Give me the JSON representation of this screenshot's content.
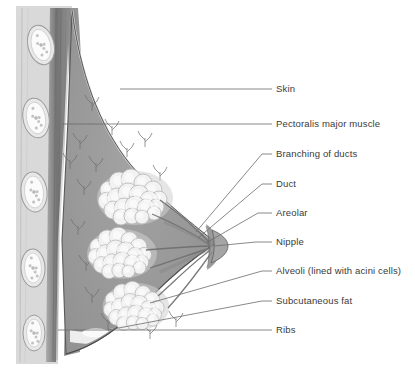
{
  "diagram": {
    "background": "#ffffff",
    "palette": {
      "skin_line": "#4a4a4a",
      "stroma": "#9a9a9a",
      "stroma_dark": "#7e7e7e",
      "muscle": "#8d8d8d",
      "muscle_dark": "#6f6f6f",
      "rib": "#e8e8e8",
      "rib_edge": "#9b9b9b",
      "lobule": "#f2f2f2",
      "lobule_edge": "#b5b5b5",
      "fat": "#f4f4f4",
      "areola": "#8a8a8a",
      "nipple": "#a5a5a5",
      "leader": "#6b6b6b",
      "text": "#3a3a3a"
    }
  },
  "labels": [
    {
      "id": "skin",
      "text": "Skin",
      "text_x": 276,
      "text_y": 89,
      "dash_x1": 262,
      "dash_x2": 272,
      "leader_x": 262,
      "leader_y": 89,
      "target_x": 120,
      "target_y": 89
    },
    {
      "id": "pectoralis",
      "text": "Pectoralis major muscle",
      "text_x": 276,
      "text_y": 124,
      "dash_x1": 262,
      "dash_x2": 272,
      "leader_x": 262,
      "leader_y": 124,
      "target_x": 62,
      "target_y": 124
    },
    {
      "id": "branching",
      "text": "Branching of ducts",
      "text_x": 276,
      "text_y": 154,
      "dash_x1": 262,
      "dash_x2": 272,
      "leader_x": 262,
      "leader_y": 154,
      "target_x": 196,
      "target_y": 232
    },
    {
      "id": "duct",
      "text": "Duct",
      "text_x": 276,
      "text_y": 184,
      "dash_x1": 262,
      "dash_x2": 272,
      "leader_x": 262,
      "leader_y": 184,
      "target_x": 198,
      "target_y": 238
    },
    {
      "id": "areolar",
      "text": "Areolar",
      "text_x": 276,
      "text_y": 213,
      "dash_x1": 258,
      "dash_x2": 272,
      "leader_x": 258,
      "leader_y": 213,
      "target_x": 206,
      "target_y": 243
    },
    {
      "id": "nipple",
      "text": "Nipple",
      "text_x": 276,
      "text_y": 242,
      "dash_x1": 256,
      "dash_x2": 272,
      "leader_x": 256,
      "leader_y": 242,
      "target_x": 214,
      "target_y": 246
    },
    {
      "id": "alveoli",
      "text": "Alveoli (lined with acini cells)",
      "text_x": 276,
      "text_y": 271,
      "dash_x1": 262,
      "dash_x2": 272,
      "leader_x": 262,
      "leader_y": 271,
      "target_x": 150,
      "target_y": 303
    },
    {
      "id": "subcutaneous",
      "text": "Subcutaneous fat",
      "text_x": 276,
      "text_y": 301,
      "dash_x1": 262,
      "dash_x2": 272,
      "leader_x": 262,
      "leader_y": 301,
      "target_x": 108,
      "target_y": 330
    },
    {
      "id": "ribs",
      "text": "Ribs",
      "text_x": 276,
      "text_y": 330,
      "dash_x1": 262,
      "dash_x2": 272,
      "leader_x": 262,
      "leader_y": 330,
      "target_x": 58,
      "target_y": 330
    }
  ],
  "anatomy": {
    "ribs": [
      {
        "cx": 41,
        "cy": 45,
        "rx": 13,
        "ry": 20,
        "rot": -14
      },
      {
        "cx": 36,
        "cy": 118,
        "rx": 13,
        "ry": 20,
        "rot": -10
      },
      {
        "cx": 34,
        "cy": 192,
        "rx": 13,
        "ry": 20,
        "rot": -6
      },
      {
        "cx": 33,
        "cy": 268,
        "rx": 12,
        "ry": 19,
        "rot": -2
      },
      {
        "cx": 34,
        "cy": 333,
        "rx": 11,
        "ry": 18,
        "rot": 0
      }
    ],
    "lobules": [
      {
        "cx": 135,
        "cy": 196,
        "scale": 1.0
      },
      {
        "cx": 122,
        "cy": 252,
        "scale": 0.92
      },
      {
        "cx": 136,
        "cy": 305,
        "scale": 0.88
      }
    ],
    "duct_twigs": [
      {
        "x": 92,
        "y": 102
      },
      {
        "x": 112,
        "y": 126
      },
      {
        "x": 80,
        "y": 140
      },
      {
        "x": 127,
        "y": 148
      },
      {
        "x": 96,
        "y": 163
      },
      {
        "x": 145,
        "y": 138
      },
      {
        "x": 84,
        "y": 186
      },
      {
        "x": 78,
        "y": 226
      },
      {
        "x": 86,
        "y": 262
      },
      {
        "x": 92,
        "y": 294
      },
      {
        "x": 108,
        "y": 320
      },
      {
        "x": 150,
        "y": 330
      },
      {
        "x": 176,
        "y": 318
      },
      {
        "x": 70,
        "y": 160
      },
      {
        "x": 160,
        "y": 172
      }
    ]
  }
}
